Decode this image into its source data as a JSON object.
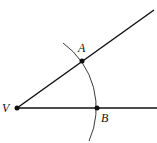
{
  "diagram": {
    "type": "geometric-construction",
    "points": [
      {
        "id": "V",
        "label": "V",
        "x": 17,
        "y": 108
      },
      {
        "id": "A",
        "label": "A",
        "x": 82,
        "y": 61
      },
      {
        "id": "B",
        "label": "B",
        "x": 97,
        "y": 108
      }
    ],
    "rays": [
      {
        "from": "V",
        "to": [
          154,
          10
        ]
      },
      {
        "from": "V",
        "to": [
          157,
          108
        ]
      }
    ],
    "arc": {
      "center": "V",
      "radius": 80
    },
    "colors": {
      "stroke": "#111111",
      "background": "#ffffff"
    }
  },
  "labels": {
    "V": "V",
    "A": "A",
    "B": "B"
  }
}
